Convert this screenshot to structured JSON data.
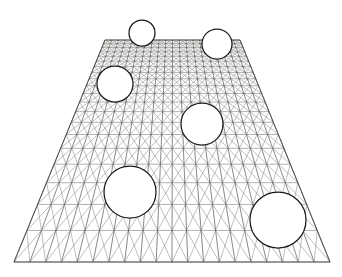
{
  "figure": {
    "canvas": {
      "width": 342,
      "height": 277
    },
    "background_color": "#ffffff"
  },
  "mesh": {
    "description": "Quadrilateral finite-element mesh in perspective projection, each cell crossed by both diagonals",
    "element_type": "quad-with-both-diagonals",
    "columns": 20,
    "rows": 20,
    "line_color": "#70706e",
    "diagonal_color": "#7d7d7a",
    "outline_color": "#4a4a46",
    "line_width": 0.55,
    "outline_width": 0.9,
    "corners": {
      "top_left": {
        "x": 105,
        "y": 40
      },
      "top_right": {
        "x": 240,
        "y": 40
      },
      "bottom_right": {
        "x": 330,
        "y": 262
      },
      "bottom_left": {
        "x": 14,
        "y": 262
      }
    },
    "perspective": {
      "enabled": true,
      "row_compression": "rows compress toward the top edge",
      "vanishing_direction": "up"
    }
  },
  "holes": {
    "count": 6,
    "stroke_color": "#1a1a1a",
    "fill_color": "#ffffff",
    "stroke_width": 1.25,
    "items": [
      {
        "id": "hole-1",
        "label": "top-left small hole",
        "cx": 142,
        "cy": 33,
        "r": 13
      },
      {
        "id": "hole-2",
        "label": "top-right hole",
        "cx": 217,
        "cy": 44,
        "r": 15
      },
      {
        "id": "hole-3",
        "label": "upper-left hole",
        "cx": 115,
        "cy": 84,
        "r": 18
      },
      {
        "id": "hole-4",
        "label": "center hole",
        "cx": 202,
        "cy": 124,
        "r": 21
      },
      {
        "id": "hole-5",
        "label": "lower-left large hole",
        "cx": 130,
        "cy": 192,
        "r": 26
      },
      {
        "id": "hole-6",
        "label": "lower-right large hole",
        "cx": 278,
        "cy": 220,
        "r": 28
      }
    ]
  },
  "chart_data": {
    "type": "diagram",
    "xlabel": "",
    "ylabel": "",
    "grid": true,
    "legend": "none",
    "annotations": []
  }
}
